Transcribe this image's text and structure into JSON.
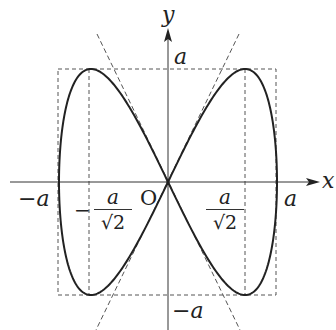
{
  "diagram": {
    "curve": "x = a sin t, y = a sin 2t",
    "axes": {
      "x_label": "x",
      "y_label": "y",
      "origin_label": "O"
    },
    "labels": {
      "y_top": "a",
      "y_bottom": "−a",
      "x_left": "−a",
      "x_right": "a",
      "neg_frac_sign": "−",
      "frac_num": "a",
      "frac_den": "√2"
    },
    "colors": {
      "line": "#222222",
      "dash": "#555555",
      "background": "#ffffff"
    }
  }
}
